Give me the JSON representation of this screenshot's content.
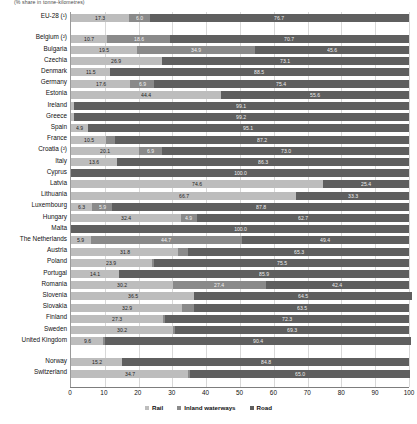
{
  "subtitle": "(% share in tonne-kilometres)",
  "legend": {
    "position": "bottom",
    "items": [
      {
        "key": "rail",
        "label": "Rail",
        "color": "#bdbdbd"
      },
      {
        "key": "iww",
        "label": "Inland waterways",
        "color": "#8a8a8a"
      },
      {
        "key": "road",
        "label": "Road",
        "color": "#5f5f5f"
      }
    ]
  },
  "axis": {
    "ticks": [
      "0",
      "10",
      "20",
      "30",
      "40",
      "50",
      "60",
      "70",
      "80",
      "90",
      "100"
    ],
    "min": 0,
    "max": 100
  },
  "chart_data": {
    "type": "bar",
    "orientation": "horizontal",
    "stacked": true,
    "title": "",
    "subtitle": "(% share in tonne-kilometres)",
    "xlabel": "",
    "ylabel": "",
    "xlim": [
      0,
      100
    ],
    "grid": true,
    "legend_position": "bottom",
    "series": [
      {
        "name": "Rail",
        "color": "#bdbdbd"
      },
      {
        "name": "Inland waterways",
        "color": "#8a8a8a"
      },
      {
        "name": "Road",
        "color": "#5f5f5f"
      }
    ],
    "categories": [
      "EU-28 (¹)",
      "Belgium (²)",
      "Bulgaria",
      "Czechia",
      "Denmark",
      "Germany",
      "Estonia",
      "Ireland",
      "Greece",
      "Spain",
      "France",
      "Croatia (²)",
      "Italy",
      "Cyprus",
      "Latvia",
      "Lithuania",
      "Luxembourg",
      "Hungary",
      "Malta",
      "The Netherlands",
      "Austria",
      "Poland",
      "Portugal",
      "Romania",
      "Slovenia",
      "Slovakia",
      "Finland",
      "Sweden",
      "United Kingdom",
      "Norway",
      "Switzerland"
    ],
    "rows": [
      {
        "category": "EU-28 (¹)",
        "rail": 17.3,
        "iww": 6.0,
        "road": 76.7,
        "gap_after": true
      },
      {
        "category": "Belgium (²)",
        "rail": 10.7,
        "iww": 18.6,
        "road": 70.7
      },
      {
        "category": "Bulgaria",
        "rail": 19.5,
        "iww": 34.9,
        "road": 45.6
      },
      {
        "category": "Czechia",
        "rail": 26.9,
        "iww": 0.0,
        "road": 73.1
      },
      {
        "category": "Denmark",
        "rail": 11.5,
        "iww": 0.0,
        "road": 88.5
      },
      {
        "category": "Germany",
        "rail": 17.6,
        "iww": 6.9,
        "road": 75.4
      },
      {
        "category": "Estonia",
        "rail": 44.4,
        "iww": 0.0,
        "road": 55.6
      },
      {
        "category": "Ireland",
        "rail": 0.9,
        "iww": 0.0,
        "road": 99.1
      },
      {
        "category": "Greece",
        "rail": 0.8,
        "iww": 0.0,
        "road": 99.2
      },
      {
        "category": "Spain",
        "rail": 4.9,
        "iww": 0.0,
        "road": 95.1
      },
      {
        "category": "France",
        "rail": 10.5,
        "iww": 2.4,
        "road": 87.2
      },
      {
        "category": "Croatia (²)",
        "rail": 20.1,
        "iww": 6.9,
        "road": 73.0
      },
      {
        "category": "Italy",
        "rail": 13.6,
        "iww": 0.1,
        "road": 86.3
      },
      {
        "category": "Cyprus",
        "rail": 0.0,
        "iww": 0.0,
        "road": 100.0
      },
      {
        "category": "Latvia",
        "rail": 74.6,
        "iww": 0.0,
        "road": 25.4
      },
      {
        "category": "Lithuania",
        "rail": 66.7,
        "iww": 0.0,
        "road": 33.3
      },
      {
        "category": "Luxembourg",
        "rail": 6.3,
        "iww": 5.9,
        "road": 87.8
      },
      {
        "category": "Hungary",
        "rail": 32.4,
        "iww": 4.9,
        "road": 62.7
      },
      {
        "category": "Malta",
        "rail": 0.0,
        "iww": 0.0,
        "road": 100.0
      },
      {
        "category": "The Netherlands",
        "rail": 5.9,
        "iww": 44.7,
        "road": 49.4
      },
      {
        "category": "Austria",
        "rail": 31.8,
        "iww": 2.9,
        "road": 65.3
      },
      {
        "category": "Poland",
        "rail": 23.9,
        "iww": 0.7,
        "road": 75.5
      },
      {
        "category": "Portugal",
        "rail": 14.1,
        "iww": 0.0,
        "road": 85.9
      },
      {
        "category": "Romania",
        "rail": 30.2,
        "iww": 27.4,
        "road": 42.4
      },
      {
        "category": "Slovenia",
        "rail": 36.5,
        "iww": 0.0,
        "road": 64.5
      },
      {
        "category": "Slovakia",
        "rail": 32.9,
        "iww": 3.6,
        "road": 63.5
      },
      {
        "category": "Finland",
        "rail": 27.3,
        "iww": 0.5,
        "road": 72.3
      },
      {
        "category": "Sweden",
        "rail": 30.2,
        "iww": 0.5,
        "road": 69.3
      },
      {
        "category": "United Kingdom",
        "rail": 9.6,
        "iww": 0.5,
        "road": 90.4,
        "gap_after": true
      },
      {
        "category": "Norway",
        "rail": 15.2,
        "iww": 0.0,
        "road": 84.8
      },
      {
        "category": "Switzerland",
        "rail": 34.7,
        "iww": 0.5,
        "road": 65.0
      }
    ]
  }
}
